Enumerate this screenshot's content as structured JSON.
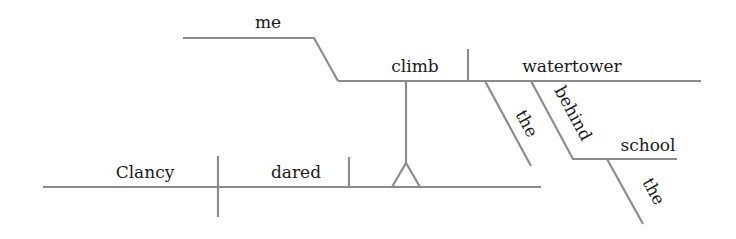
{
  "diagram": {
    "type": "sentence-diagram",
    "sentence": "Clancy dared me climb the watertower behind the school",
    "line_color": "#8c8c8c",
    "text_color": "#1a1a1a",
    "words": {
      "subject": "Clancy",
      "verb": "dared",
      "indirect_object": "me",
      "infinitive_verb": "climb",
      "infinitive_object": "watertower",
      "article_watertower": "the",
      "preposition": "behind",
      "prep_object": "school",
      "article_school": "the"
    }
  }
}
